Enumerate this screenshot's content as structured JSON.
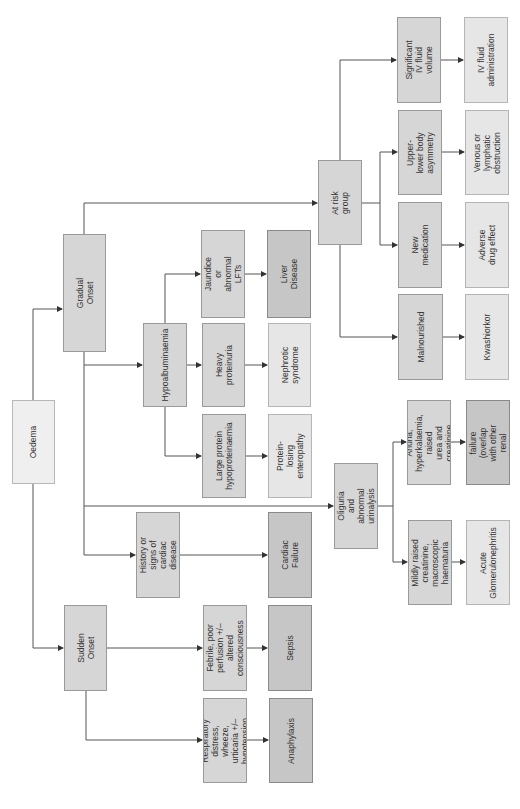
{
  "diagram": {
    "orientation": "rotated -90deg (reads bottom-to-top)",
    "colors": {
      "root_fill": "#efefef",
      "symptom_fill": "#d6d6d6",
      "diagnosis_light_fill": "#e6e6e6",
      "diagnosis_dark_fill": "#c6c6c6",
      "line": "#555555"
    },
    "nodes": {
      "oedema": "Oedema",
      "gradual_onset": "Gradual Onset",
      "sudden_onset": "Sudden Onset",
      "hypoalbuminaemia": "Hypoalbuminaemia",
      "jaundice": "Jaundice or abnormal\nLFTs",
      "heavy_proteinuria": "Heavy proteinuria",
      "large_protein": "Large protein\nhypoproteinaemia",
      "liver_disease": "Liver Disease",
      "nephrotic_syndrome": "Nephrotic syndrome",
      "protein_losing": "Protein-losing\nenteropathy",
      "cardiac_history": "History or signs of\ncardiac disease",
      "cardiac_failure": "Cardiac Failure",
      "febrile": "Febrile, poor\nperfusion +/– altered\nconsciousness",
      "respiratory": "Respiratory distress,\nwheeze, urticaria +/–\nhypotension",
      "sepsis": "Sepsis",
      "anaphylaxis": "Anaphylaxis",
      "at_risk_group": "At risk group",
      "significant_iv": "Significant IV fluid\nvolume",
      "upper_lower": "Upper-lower body\nasymmetry",
      "new_medication": "New medication",
      "malnourished": "Malnourished",
      "iv_fluid_admin": "IV fluid\nadministration",
      "venous_lymphatic": "Venous or lymphatic\nobstruction",
      "adverse_drug": "Adverse drug effect",
      "kwashiorkor": "Kwashiorkor",
      "oliguria": "Oliguria and abnormal\nurinalysis",
      "anuria": "Anuria,\nhyperkalaemia, raised\nurea and creatinine",
      "mildly_raised": "Mildly raised\ncreatinine,\nmacroscopic\nhaematuria",
      "renal_failure": "Renal failure (overlap\nwith other renal\ndisease)",
      "acute_gn": "Acute\nGlomerulonephritis"
    },
    "edges": [
      [
        "oedema",
        "gradual_onset"
      ],
      [
        "oedema",
        "sudden_onset"
      ],
      [
        "gradual_onset",
        "hypoalbuminaemia"
      ],
      [
        "gradual_onset",
        "at_risk_group"
      ],
      [
        "gradual_onset",
        "cardiac_history"
      ],
      [
        "gradual_onset",
        "oliguria"
      ],
      [
        "hypoalbuminaemia",
        "jaundice"
      ],
      [
        "hypoalbuminaemia",
        "heavy_proteinuria"
      ],
      [
        "hypoalbuminaemia",
        "large_protein"
      ],
      [
        "jaundice",
        "liver_disease"
      ],
      [
        "heavy_proteinuria",
        "nephrotic_syndrome"
      ],
      [
        "large_protein",
        "protein_losing"
      ],
      [
        "cardiac_history",
        "cardiac_failure"
      ],
      [
        "sudden_onset",
        "febrile"
      ],
      [
        "sudden_onset",
        "respiratory"
      ],
      [
        "febrile",
        "sepsis"
      ],
      [
        "respiratory",
        "anaphylaxis"
      ],
      [
        "at_risk_group",
        "significant_iv"
      ],
      [
        "at_risk_group",
        "upper_lower"
      ],
      [
        "at_risk_group",
        "new_medication"
      ],
      [
        "at_risk_group",
        "malnourished"
      ],
      [
        "significant_iv",
        "iv_fluid_admin"
      ],
      [
        "upper_lower",
        "venous_lymphatic"
      ],
      [
        "new_medication",
        "adverse_drug"
      ],
      [
        "malnourished",
        "kwashiorkor"
      ],
      [
        "oliguria",
        "anuria"
      ],
      [
        "oliguria",
        "mildly_raised"
      ],
      [
        "anuria",
        "renal_failure"
      ],
      [
        "mildly_raised",
        "acute_gn"
      ]
    ]
  }
}
